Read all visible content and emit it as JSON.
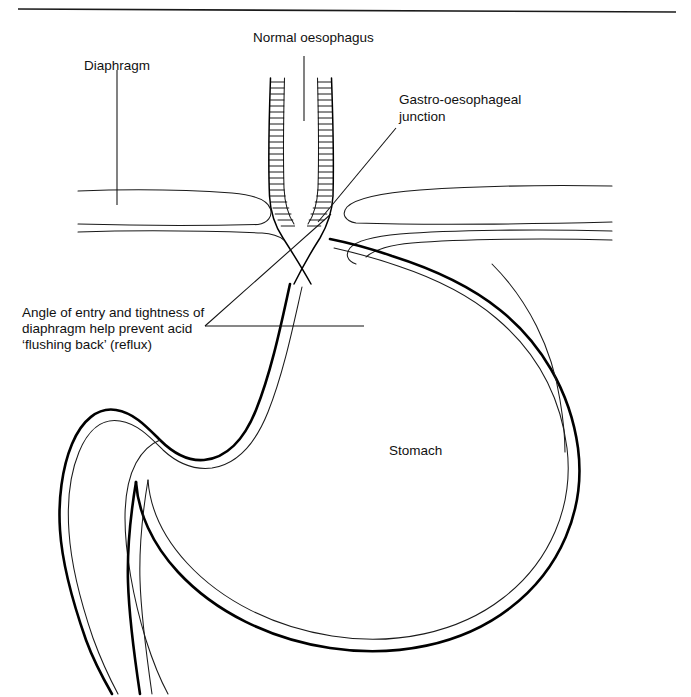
{
  "figure": {
    "title_rule": "top-divider",
    "background_color": "#ffffff",
    "line_color": "#000000",
    "labels": {
      "normal_oesophagus": "Normal oesophagus",
      "diaphragm": "Diaphragm",
      "gastro_oesophageal_junction_line1": "Gastro-oesophageal",
      "gastro_oesophageal_junction_line2": "junction",
      "stomach": "Stomach",
      "angle_line1": "Angle of entry and tightness of",
      "angle_line2": "diaphragm help prevent acid",
      "angle_line3": "‘flushing back’ (reflux)"
    },
    "structures": [
      "oesophagus",
      "diaphragm-left",
      "diaphragm-right",
      "gastro-oesophageal-junction",
      "stomach-body",
      "duodenum"
    ]
  }
}
